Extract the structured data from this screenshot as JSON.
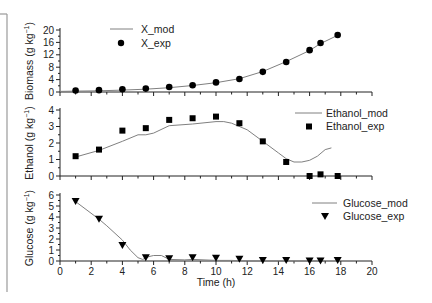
{
  "chart_data": [
    {
      "type": "scatter",
      "panel": "top",
      "title": "",
      "xlabel": "",
      "ylabel": "Biomass (g kg⁻¹)",
      "xlim": [
        0,
        20
      ],
      "ylim": [
        0,
        20
      ],
      "yticks": [
        0,
        4,
        8,
        12,
        16,
        20
      ],
      "grid": false,
      "legend_position": "upper-left-center",
      "series": [
        {
          "name": "X_mod",
          "style": "line",
          "x": [
            0,
            1,
            2.5,
            4,
            5.5,
            7,
            8.5,
            10,
            11.5,
            13,
            14.5,
            16,
            16.7,
            17.8
          ],
          "y": [
            0.2,
            0.3,
            0.4,
            0.6,
            0.9,
            1.4,
            2.1,
            3.0,
            4.3,
            6.6,
            9.8,
            13.4,
            15.6,
            18.3
          ]
        },
        {
          "name": "X_exp",
          "style": "marker-circle",
          "x": [
            1,
            2.5,
            4,
            5.5,
            7,
            8.5,
            10,
            11.5,
            13,
            14.5,
            16,
            16.7,
            17.8
          ],
          "y": [
            0.5,
            0.6,
            0.9,
            1.1,
            1.6,
            2.2,
            3.1,
            4.2,
            6.5,
            9.7,
            13.5,
            15.8,
            18.4
          ]
        }
      ]
    },
    {
      "type": "scatter",
      "panel": "middle",
      "title": "",
      "xlabel": "",
      "ylabel": "Ethanol (g kg⁻¹)",
      "xlim": [
        0,
        20
      ],
      "ylim": [
        0,
        4
      ],
      "yticks": [
        0,
        1,
        2,
        3,
        4
      ],
      "grid": false,
      "legend_position": "upper-right",
      "series": [
        {
          "name": "Ethanol_mod",
          "style": "line",
          "x": [
            1,
            2.5,
            4,
            5,
            5.5,
            6,
            7,
            8.5,
            10,
            10.5,
            11,
            12,
            13,
            14,
            14.5,
            15,
            15.5,
            16,
            16.5,
            17,
            17.4
          ],
          "y": [
            1.15,
            1.55,
            2.1,
            2.5,
            2.5,
            2.6,
            3.05,
            3.15,
            3.3,
            3.3,
            3.2,
            2.8,
            2.1,
            1.4,
            1.05,
            0.85,
            0.85,
            0.95,
            1.2,
            1.6,
            1.7
          ]
        },
        {
          "name": "Ethanol_exp",
          "style": "marker-square",
          "x": [
            1,
            2.5,
            4,
            5.5,
            7,
            8.5,
            10,
            11.5,
            13,
            14.5,
            16,
            16.7,
            17.8
          ],
          "y": [
            1.2,
            1.6,
            2.75,
            2.9,
            3.4,
            3.5,
            3.6,
            3.2,
            2.1,
            0.85,
            0.0,
            0.1,
            0.0
          ]
        }
      ]
    },
    {
      "type": "scatter",
      "panel": "bottom",
      "title": "",
      "xlabel": "Time (h)",
      "ylabel": "Glucose (g kg⁻¹)",
      "xlim": [
        0,
        20
      ],
      "ylim": [
        0,
        6
      ],
      "xticks": [
        0,
        2,
        4,
        6,
        8,
        10,
        12,
        14,
        16,
        18,
        20
      ],
      "yticks": [
        0,
        1,
        2,
        3,
        4,
        5,
        6
      ],
      "grid": false,
      "legend_position": "upper-right",
      "series": [
        {
          "name": "Glucose_mod",
          "style": "line",
          "x": [
            1,
            2.5,
            3,
            4,
            4.5,
            5,
            5.3,
            5.7,
            6,
            6.5,
            7,
            8,
            8.5,
            10,
            11,
            12,
            14,
            16,
            17
          ],
          "y": [
            5.4,
            3.8,
            3.2,
            1.9,
            1.0,
            0.3,
            0.15,
            0.4,
            0.5,
            0.5,
            0.15,
            0.1,
            0.15,
            0.05,
            0.05,
            0.0,
            0.0,
            0.0,
            0.0
          ]
        },
        {
          "name": "Glucose_exp",
          "style": "marker-triangle-down",
          "x": [
            1,
            2.5,
            4,
            5.5,
            7,
            8.5,
            10,
            11.5,
            13,
            14.5,
            16,
            16.7,
            17.8
          ],
          "y": [
            5.4,
            3.8,
            1.4,
            0.3,
            0.2,
            0.3,
            0.25,
            0.15,
            0.05,
            0.05,
            0.0,
            0.0,
            0.05
          ]
        }
      ]
    }
  ],
  "labels": {
    "biomass_y": "Biomass (g kg",
    "ethanol_y": "Ethanol (g kg",
    "glucose_y": "Glucose (g kg",
    "sup": "−1",
    "close_paren": ")",
    "x_axis": "Time (h)",
    "legend_xmod": "X_mod",
    "legend_xexp": "X_exp",
    "legend_emod": "Ethanol_mod",
    "legend_eexp": "Ethanol_exp",
    "legend_gmod": "Glucose_mod",
    "legend_gexp": "Glucose_exp"
  },
  "colors": {
    "line": "#808080",
    "marker": "#000000",
    "axis": "#222222",
    "frame": "#9a9a9a"
  }
}
